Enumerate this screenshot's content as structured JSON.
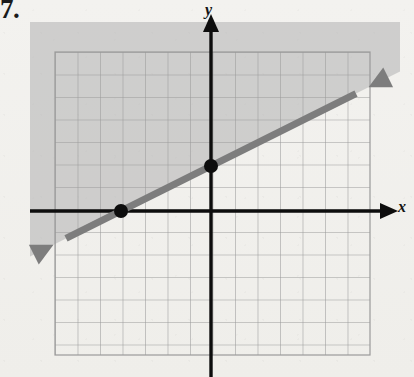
{
  "figure": {
    "number_label": "7.",
    "caption": ""
  },
  "axes": {
    "x_label": "x",
    "y_label": "y",
    "x_arrow": "arrow-right",
    "y_arrow": "arrow-up",
    "origin_px": [
      211,
      211
    ],
    "unit_px": 22.5,
    "axis_color": "#0d0d0d"
  },
  "grid": {
    "left_px": 55,
    "top_px": 52,
    "right_px": 370,
    "bottom_px": 355,
    "cols": 14,
    "rows": 13,
    "cell_px": 22.5,
    "line_color": "#9a9a9a"
  },
  "shading": {
    "fill_color": "#b8b8b8",
    "opacity": 0.62,
    "description": "region-above-line",
    "bounds_px": [
      30,
      22,
      400,
      300
    ]
  },
  "boundary_line": {
    "style": "solid",
    "color": "#7d7d7d",
    "width_px": 7,
    "arrow_both_ends": true,
    "start_px": [
      32,
      288
    ],
    "end_px": [
      396,
      44
    ]
  },
  "chart_data": {
    "type": "line",
    "title": "",
    "xlabel": "x",
    "ylabel": "y",
    "xlim": [
      -7,
      7
    ],
    "ylim": [
      -6.5,
      7
    ],
    "grid": true,
    "legend": null,
    "series": [
      {
        "name": "boundary",
        "equation": "y = 0.5x + 2",
        "slope": 0.5,
        "intercept": 2,
        "style": "solid",
        "color": "#7d7d7d",
        "x": [
          -7,
          7
        ],
        "y": [
          -1.5,
          5.5
        ]
      }
    ],
    "points": [
      {
        "label": "x-intercept",
        "x": -4,
        "y": 0
      },
      {
        "label": "y-intercept",
        "x": 0,
        "y": 2
      }
    ],
    "shaded_region": {
      "inequality": "y >= 0.5x + 2",
      "side": "above",
      "fill": "#b8b8b8"
    },
    "annotations": [
      "7."
    ]
  }
}
